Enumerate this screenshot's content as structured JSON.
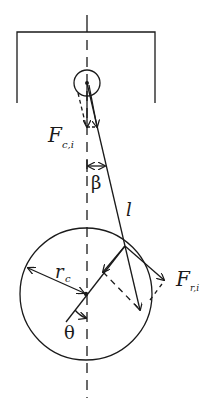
{
  "diagram": {
    "colors": {
      "stroke": "#1a1a1a",
      "background": "#ffffff"
    },
    "labels": {
      "piston_force": {
        "main": "F",
        "sub": "c,i"
      },
      "rod_angle": "β",
      "rod_length": "l",
      "crank_radius": {
        "main": "r",
        "sub": "c"
      },
      "radial_force": {
        "main": "F",
        "sub": "r,i"
      },
      "crank_angle": "θ"
    },
    "geometry": {
      "centerline_x": 86,
      "piston": {
        "left": 17,
        "right": 155,
        "top": 32,
        "bottom": 103
      },
      "wrist_pin": {
        "cx": 87,
        "cy": 83,
        "r": 13
      },
      "crank_circle": {
        "cx": 86,
        "cy": 294,
        "r": 66
      },
      "crank_pin": {
        "x": 125,
        "y": 246
      }
    }
  }
}
